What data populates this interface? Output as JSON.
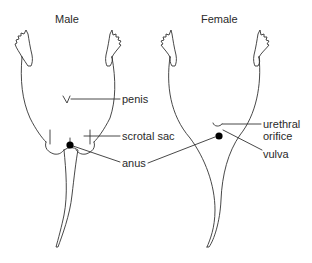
{
  "diagram": {
    "panels": [
      {
        "title": "Male",
        "labels": {
          "penis": "penis",
          "scrotal_sac": "scrotal sac",
          "anus": "anus"
        }
      },
      {
        "title": "Female",
        "labels": {
          "urethral_orifice_line1": "urethral",
          "urethral_orifice_line2": "orifice",
          "vulva": "vulva"
        }
      }
    ],
    "colors": {
      "line": "#333333",
      "dot": "#000000",
      "background": "#ffffff"
    }
  }
}
